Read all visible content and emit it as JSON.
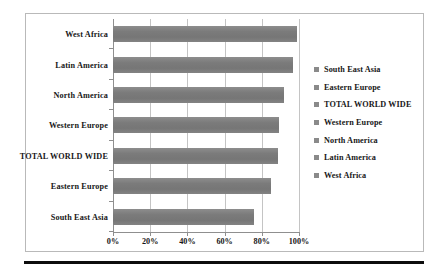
{
  "chart_data": {
    "type": "bar",
    "orientation": "horizontal",
    "title": "",
    "subtitle": "",
    "xlabel": "",
    "ylabel": "",
    "categories": [
      "West Africa",
      "Latin America",
      "North America",
      "Western Europe",
      "TOTAL WORLD WIDE",
      "Eastern Europe",
      "South East Asia"
    ],
    "values": [
      99,
      97,
      92,
      89,
      88.5,
      85,
      76
    ],
    "value_unit": "%",
    "xlim": [
      0,
      100
    ],
    "x_ticks": [
      0,
      20,
      40,
      60,
      80,
      100
    ],
    "x_tick_labels": [
      "0%",
      "20%",
      "40%",
      "60%",
      "80%",
      "100%"
    ],
    "grid": "vertical",
    "legend_position": "right",
    "legend_entries": [
      "South East Asia",
      "Eastern Europe",
      "TOTAL WORLD WIDE",
      "Western Europe",
      "North America",
      "Latin America",
      "West Africa"
    ],
    "series": [
      {
        "name": "Coverage",
        "values": [
          99,
          97,
          92,
          89,
          88.5,
          85,
          76
        ]
      }
    ],
    "colors": {
      "bar": "#7b7b7b",
      "legend_swatch": "#8a8a8a",
      "gridline": "#c4c4c4",
      "axis": "#8f8f8f",
      "frame": "#b9b9b9",
      "rule": "#0d0d0d",
      "text": "#171717",
      "background": "#ffffff"
    }
  }
}
